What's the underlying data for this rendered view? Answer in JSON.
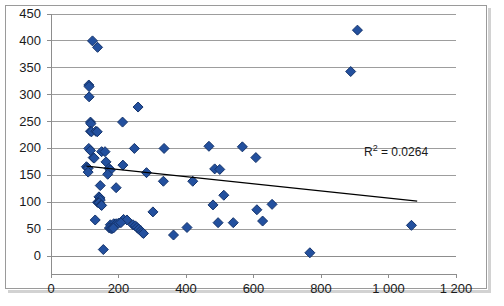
{
  "chart_data": {
    "type": "scatter",
    "title": "",
    "xlabel": "",
    "ylabel": "",
    "xlim": [
      0,
      1200
    ],
    "ylim": [
      0,
      450
    ],
    "xticks": [
      0,
      200,
      400,
      600,
      800,
      1000,
      1200
    ],
    "xtick_labels": [
      "0",
      "200",
      "400",
      "600",
      "800",
      "1 000",
      "1 200"
    ],
    "yticks": [
      0,
      50,
      100,
      150,
      200,
      250,
      300,
      350,
      400,
      450
    ],
    "ytick_labels": [
      "0",
      "50",
      "100",
      "150",
      "200",
      "250",
      "300",
      "350",
      "400",
      "450"
    ],
    "grid": "horizontal",
    "legend": "none",
    "marker": {
      "shape": "diamond",
      "color": "#23509E",
      "edge_color": "#14336B",
      "size": 7
    },
    "series": [
      {
        "name": "data",
        "points": [
          [
            123,
            400
          ],
          [
            138,
            388
          ],
          [
            112,
            318
          ],
          [
            113,
            315
          ],
          [
            113,
            296
          ],
          [
            258,
            277
          ],
          [
            117,
            249
          ],
          [
            118,
            246
          ],
          [
            212,
            249
          ],
          [
            117,
            232
          ],
          [
            120,
            231
          ],
          [
            133,
            232
          ],
          [
            137,
            231
          ],
          [
            112,
            200
          ],
          [
            117,
            196
          ],
          [
            150,
            194
          ],
          [
            160,
            194
          ],
          [
            247,
            200
          ],
          [
            335,
            200
          ],
          [
            125,
            183
          ],
          [
            128,
            182
          ],
          [
            163,
            175
          ],
          [
            213,
            169
          ],
          [
            485,
            162
          ],
          [
            500,
            161
          ],
          [
            607,
            183
          ],
          [
            105,
            166
          ],
          [
            108,
            164
          ],
          [
            110,
            163
          ],
          [
            172,
            163
          ],
          [
            176,
            160
          ],
          [
            110,
            156
          ],
          [
            168,
            152
          ],
          [
            333,
            139
          ],
          [
            420,
            139
          ],
          [
            146,
            131
          ],
          [
            193,
            127
          ],
          [
            512,
            113
          ],
          [
            142,
            110
          ],
          [
            145,
            108
          ],
          [
            146,
            104
          ],
          [
            138,
            100
          ],
          [
            140,
            99
          ],
          [
            143,
            99
          ],
          [
            480,
            95
          ],
          [
            655,
            96
          ],
          [
            148,
            95
          ],
          [
            150,
            94
          ],
          [
            302,
            82
          ],
          [
            610,
            86
          ],
          [
            131,
            67
          ],
          [
            215,
            68
          ],
          [
            225,
            67
          ],
          [
            495,
            62
          ],
          [
            540,
            62
          ],
          [
            627,
            65
          ],
          [
            176,
            58
          ],
          [
            186,
            60
          ],
          [
            193,
            60
          ],
          [
            200,
            61
          ],
          [
            207,
            62
          ],
          [
            173,
            52
          ],
          [
            178,
            51
          ],
          [
            181,
            51
          ],
          [
            185,
            52
          ],
          [
            243,
            58
          ],
          [
            250,
            56
          ],
          [
            255,
            53
          ],
          [
            260,
            50
          ],
          [
            266,
            47
          ],
          [
            270,
            44
          ],
          [
            274,
            42
          ],
          [
            403,
            53
          ],
          [
            363,
            39
          ],
          [
            155,
            12
          ],
          [
            888,
            343
          ],
          [
            1068,
            57
          ],
          [
            767,
            6
          ],
          [
            908,
            420
          ],
          [
            567,
            203
          ],
          [
            468,
            204
          ],
          [
            283,
            155
          ]
        ]
      }
    ],
    "trendline": {
      "label": "R² = 0.0264",
      "r_squared": 0.0264,
      "color": "#000000",
      "x_start": 105,
      "y_start": 167,
      "x_end": 1085,
      "y_end": 102
    },
    "annotations": [
      {
        "text": "R² = 0.0264",
        "x_px": 364,
        "y_px": 142
      }
    ]
  },
  "axis": {
    "y_labels": [
      "450",
      "400",
      "350",
      "300",
      "250",
      "200",
      "150",
      "100",
      "50",
      "0"
    ],
    "x_labels": [
      "0",
      "200",
      "400",
      "600",
      "800",
      "1 000",
      "1 200"
    ]
  },
  "annotation": {
    "r2_prefix": "R",
    "r2_sup": "2",
    "r2_value": " = 0.0264"
  }
}
